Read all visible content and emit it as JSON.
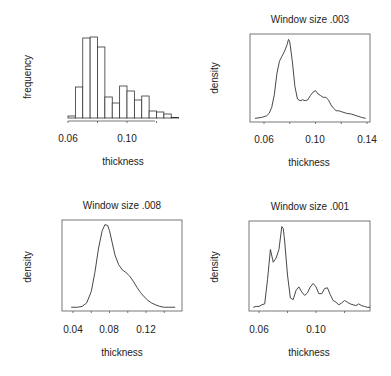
{
  "chart_data": [
    {
      "type": "bar",
      "panel": "top-left",
      "title": "",
      "xlabel": "thickness",
      "ylabel": "frequency",
      "xticks": [
        "0.06",
        "0.10"
      ],
      "xtick_values": [
        0.06,
        0.08,
        0.1,
        0.12
      ],
      "xlim": [
        0.06,
        0.135
      ],
      "bin_width": 0.005,
      "bins": [
        0.06,
        0.065,
        0.07,
        0.075,
        0.08,
        0.085,
        0.09,
        0.095,
        0.1,
        0.105,
        0.11,
        0.115,
        0.12,
        0.125,
        0.13
      ],
      "values": [
        2,
        31,
        80,
        81,
        71,
        21,
        15,
        32,
        27,
        18,
        22,
        7,
        6,
        4,
        0.5
      ],
      "grid": false,
      "frame": false
    },
    {
      "type": "line",
      "panel": "top-right",
      "title": "Window size .003",
      "xlabel": "thickness",
      "ylabel": "density",
      "xticks": [
        "0.06",
        "0.10",
        "0.14"
      ],
      "xtick_values": [
        0.06,
        0.08,
        0.1,
        0.12,
        0.14
      ],
      "xlim": [
        0.052,
        0.14
      ],
      "x": [
        0.053,
        0.058,
        0.062,
        0.064,
        0.066,
        0.068,
        0.07,
        0.072,
        0.074,
        0.076,
        0.078,
        0.079,
        0.08,
        0.082,
        0.084,
        0.086,
        0.088,
        0.09,
        0.092,
        0.094,
        0.096,
        0.098,
        0.1,
        0.102,
        0.104,
        0.106,
        0.108,
        0.11,
        0.112,
        0.114,
        0.116,
        0.118,
        0.12,
        0.124,
        0.128,
        0.132,
        0.136,
        0.139
      ],
      "y": [
        0.02,
        0.03,
        0.05,
        0.08,
        0.15,
        0.3,
        0.55,
        0.7,
        0.76,
        0.82,
        0.9,
        0.96,
        0.93,
        0.7,
        0.4,
        0.25,
        0.23,
        0.24,
        0.23,
        0.24,
        0.29,
        0.33,
        0.35,
        0.31,
        0.29,
        0.27,
        0.27,
        0.24,
        0.18,
        0.14,
        0.11,
        0.11,
        0.1,
        0.08,
        0.07,
        0.05,
        0.03,
        0.02
      ],
      "grid": false,
      "frame": true
    },
    {
      "type": "line",
      "panel": "bottom-left",
      "title": "Window size .008",
      "xlabel": "thickness",
      "ylabel": "density",
      "xticks": [
        "0.04",
        "0.08",
        "0.12"
      ],
      "xtick_values": [
        0.04,
        0.06,
        0.08,
        0.1,
        0.12,
        0.14
      ],
      "xlim": [
        0.035,
        0.155
      ],
      "x": [
        0.038,
        0.045,
        0.05,
        0.055,
        0.06,
        0.064,
        0.068,
        0.072,
        0.075,
        0.078,
        0.08,
        0.083,
        0.086,
        0.09,
        0.094,
        0.098,
        0.102,
        0.106,
        0.11,
        0.114,
        0.118,
        0.122,
        0.126,
        0.13,
        0.135,
        0.14,
        0.145,
        0.152
      ],
      "y": [
        0.02,
        0.02,
        0.03,
        0.07,
        0.2,
        0.42,
        0.7,
        0.9,
        0.97,
        0.96,
        0.9,
        0.76,
        0.62,
        0.51,
        0.45,
        0.42,
        0.38,
        0.32,
        0.25,
        0.19,
        0.14,
        0.1,
        0.07,
        0.05,
        0.03,
        0.02,
        0.02,
        0.02
      ],
      "grid": false,
      "frame": true
    },
    {
      "type": "line",
      "panel": "bottom-right",
      "title": "Window size .001",
      "xlabel": "thickness",
      "ylabel": "density",
      "xticks": [
        "0.06",
        "0.10"
      ],
      "xtick_values": [
        0.06,
        0.08,
        0.1,
        0.12
      ],
      "xlim": [
        0.055,
        0.14
      ],
      "x": [
        0.056,
        0.058,
        0.06,
        0.062,
        0.064,
        0.066,
        0.068,
        0.07,
        0.072,
        0.074,
        0.076,
        0.077,
        0.078,
        0.08,
        0.082,
        0.084,
        0.086,
        0.088,
        0.09,
        0.092,
        0.094,
        0.096,
        0.098,
        0.1,
        0.102,
        0.104,
        0.106,
        0.108,
        0.11,
        0.112,
        0.114,
        0.116,
        0.118,
        0.12,
        0.122,
        0.124,
        0.126,
        0.128,
        0.13,
        0.132,
        0.134,
        0.136,
        0.138
      ],
      "y": [
        0.02,
        0.03,
        0.03,
        0.05,
        0.06,
        0.35,
        0.7,
        0.55,
        0.6,
        0.7,
        0.97,
        0.95,
        0.8,
        0.4,
        0.13,
        0.11,
        0.22,
        0.26,
        0.2,
        0.16,
        0.19,
        0.26,
        0.3,
        0.26,
        0.18,
        0.18,
        0.24,
        0.25,
        0.17,
        0.1,
        0.08,
        0.05,
        0.07,
        0.1,
        0.08,
        0.06,
        0.05,
        0.04,
        0.06,
        0.04,
        0.03,
        0.02,
        0.02
      ],
      "grid": false,
      "frame": true
    }
  ],
  "panels": [
    {
      "title": "",
      "xlabel": "thickness",
      "ylabel": "frequency",
      "ticks": [
        "0.06",
        "0.10"
      ]
    },
    {
      "title": "Window size .003",
      "xlabel": "thickness",
      "ylabel": "density",
      "ticks": [
        "0.06",
        "0.10",
        "0.14"
      ]
    },
    {
      "title": "Window size .008",
      "xlabel": "thickness",
      "ylabel": "density",
      "ticks": [
        "0.04",
        "0.08",
        "0.12"
      ]
    },
    {
      "title": "Window size .001",
      "xlabel": "thickness",
      "ylabel": "density",
      "ticks": [
        "0.06",
        "0.10"
      ]
    }
  ],
  "colors": {
    "line": "#333333",
    "frame": "#555555",
    "text": "#222222",
    "bar_fill": "#ffffff"
  }
}
